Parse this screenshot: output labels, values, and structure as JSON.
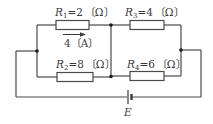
{
  "diagram": {
    "type": "electric-circuit",
    "colors": {
      "wire": "#4a4a4a",
      "node": "#1a1a1a",
      "text": "#3a3a3a",
      "background": "#ffffff"
    },
    "resistors": [
      {
        "id": "R1",
        "symbol": "R",
        "subscript": "1",
        "equals": "=2",
        "unit": "〔Ω〕",
        "position": "top-left"
      },
      {
        "id": "R2",
        "symbol": "R",
        "subscript": "2",
        "equals": "=8",
        "unit": "〔Ω〕",
        "position": "bottom-left"
      },
      {
        "id": "R3",
        "symbol": "R",
        "subscript": "3",
        "equals": "=4",
        "unit": "〔Ω〕",
        "position": "top-right"
      },
      {
        "id": "R4",
        "symbol": "R",
        "subscript": "4",
        "equals": "=6",
        "unit": "〔Ω〕",
        "position": "bottom-right"
      }
    ],
    "current": {
      "label": "4〔A〕",
      "through": "R1",
      "direction": "left-to-right"
    },
    "source": {
      "label": "E",
      "type": "battery"
    }
  }
}
